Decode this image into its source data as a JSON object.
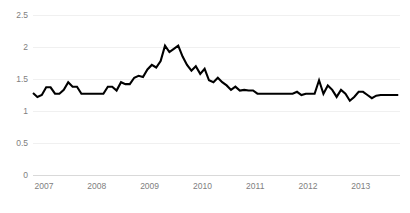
{
  "chart_data": {
    "type": "line",
    "title": "",
    "subtitle": "",
    "xlabel": "",
    "ylabel": "",
    "xlim": [
      2007.0,
      2013.95
    ],
    "ylim": [
      0,
      2.5
    ],
    "grid": true,
    "grid_axis": "y",
    "legend": false,
    "legend_position": "none",
    "y_ticks": [
      0,
      0.5,
      1,
      1.5,
      2,
      2.5
    ],
    "y_tick_labels": [
      "0",
      "0.5",
      "1",
      "1.5",
      "2",
      "2.5"
    ],
    "x_ticks": [
      2007,
      2008,
      2009,
      2010,
      2011,
      2012,
      2013
    ],
    "x_tick_labels": [
      "2007",
      "2008",
      "2009",
      "2010",
      "2011",
      "2012",
      "2013"
    ],
    "series": [
      {
        "name": "series-1",
        "color": "#000000",
        "x": [
          2007.0,
          2007.083,
          2007.167,
          2007.25,
          2007.333,
          2007.417,
          2007.5,
          2007.583,
          2007.667,
          2007.75,
          2007.833,
          2007.917,
          2008.0,
          2008.083,
          2008.167,
          2008.25,
          2008.333,
          2008.417,
          2008.5,
          2008.583,
          2008.667,
          2008.75,
          2008.833,
          2008.917,
          2009.0,
          2009.083,
          2009.167,
          2009.25,
          2009.333,
          2009.417,
          2009.5,
          2009.583,
          2009.667,
          2009.75,
          2009.833,
          2009.917,
          2010.0,
          2010.083,
          2010.167,
          2010.25,
          2010.333,
          2010.417,
          2010.5,
          2010.583,
          2010.667,
          2010.75,
          2010.833,
          2010.917,
          2011.0,
          2011.083,
          2011.167,
          2011.25,
          2011.333,
          2011.417,
          2011.5,
          2011.583,
          2011.667,
          2011.75,
          2011.833,
          2011.917,
          2012.0,
          2012.083,
          2012.167,
          2012.25,
          2012.333,
          2012.417,
          2012.5,
          2012.583,
          2012.667,
          2012.75,
          2012.833,
          2012.917,
          2013.0,
          2013.083,
          2013.167,
          2013.25,
          2013.333,
          2013.417,
          2013.5,
          2013.583,
          2013.667,
          2013.75,
          2013.833,
          2013.917
        ],
        "values": [
          1.28,
          1.22,
          1.25,
          1.37,
          1.37,
          1.27,
          1.27,
          1.33,
          1.45,
          1.38,
          1.38,
          1.27,
          1.27,
          1.27,
          1.27,
          1.27,
          1.27,
          1.38,
          1.38,
          1.32,
          1.45,
          1.42,
          1.42,
          1.52,
          1.55,
          1.53,
          1.65,
          1.72,
          1.68,
          1.78,
          2.02,
          1.92,
          1.97,
          2.02,
          1.85,
          1.72,
          1.63,
          1.7,
          1.58,
          1.66,
          1.48,
          1.45,
          1.52,
          1.45,
          1.4,
          1.33,
          1.38,
          1.32,
          1.33,
          1.32,
          1.32,
          1.27,
          1.27,
          1.27,
          1.27,
          1.27,
          1.27,
          1.27,
          1.27,
          1.27,
          1.3,
          1.25,
          1.27,
          1.27,
          1.27,
          1.48,
          1.27,
          1.4,
          1.33,
          1.22,
          1.33,
          1.27,
          1.16,
          1.22,
          1.3,
          1.3,
          1.25,
          1.2,
          1.24,
          1.25,
          1.25,
          1.25,
          1.25,
          1.25
        ]
      }
    ]
  },
  "colors": {
    "line": "#000000",
    "grid": "#f0f0f0",
    "axis": "#d9d9d9",
    "tick_text": "#808080",
    "background": "#ffffff"
  }
}
